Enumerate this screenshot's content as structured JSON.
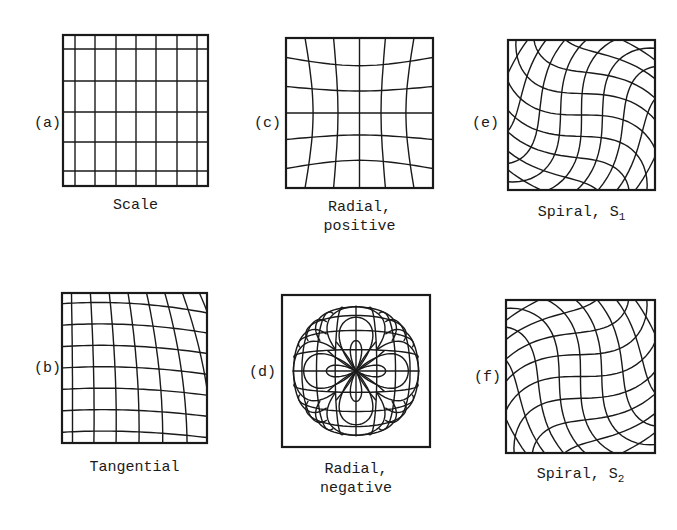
{
  "figure": {
    "panels": [
      {
        "id": "a",
        "label": "(a)",
        "caption_lines": [
          "Scale"
        ],
        "type": "scale",
        "box": {
          "x": 63,
          "y": 35,
          "w": 145,
          "h": 151
        },
        "label_pos": {
          "x": 34,
          "y": 116
        },
        "caption_pos": {
          "x": 63,
          "y": 196,
          "w": 145
        }
      },
      {
        "id": "c",
        "label": "(c)",
        "caption_lines": [
          "Radial,",
          "positive"
        ],
        "type": "pincushion",
        "box": {
          "x": 286,
          "y": 38,
          "w": 147,
          "h": 150
        },
        "label_pos": {
          "x": 254,
          "y": 116
        },
        "caption_pos": {
          "x": 286,
          "y": 198,
          "w": 147
        }
      },
      {
        "id": "e",
        "label": "(e)",
        "caption_lines": [
          "Spiral, S"
        ],
        "caption_sub": "1",
        "type": "spiral1",
        "box": {
          "x": 508,
          "y": 40,
          "w": 147,
          "h": 150
        },
        "label_pos": {
          "x": 472,
          "y": 116
        },
        "caption_pos": {
          "x": 508,
          "y": 203,
          "w": 147
        }
      },
      {
        "id": "b",
        "label": "(b)",
        "caption_lines": [
          "Tangential"
        ],
        "type": "tangential",
        "box": {
          "x": 62,
          "y": 293,
          "w": 145,
          "h": 150
        },
        "label_pos": {
          "x": 34,
          "y": 361
        },
        "caption_pos": {
          "x": 62,
          "y": 458,
          "w": 145
        }
      },
      {
        "id": "d",
        "label": "(d)",
        "caption_lines": [
          "Radial,",
          "negative"
        ],
        "type": "barrel",
        "box": {
          "x": 282,
          "y": 295,
          "w": 148,
          "h": 152
        },
        "label_pos": {
          "x": 249,
          "y": 365
        },
        "caption_pos": {
          "x": 282,
          "y": 460,
          "w": 148
        }
      },
      {
        "id": "f",
        "label": "(f)",
        "caption_lines": [
          "Spiral, S"
        ],
        "caption_sub": "2",
        "type": "spiral2",
        "box": {
          "x": 506,
          "y": 300,
          "w": 149,
          "h": 153
        },
        "label_pos": {
          "x": 474,
          "y": 370
        },
        "caption_pos": {
          "x": 506,
          "y": 465,
          "w": 149
        }
      }
    ],
    "stroke_color": "#1a1a1a",
    "background": "#ffffff"
  }
}
